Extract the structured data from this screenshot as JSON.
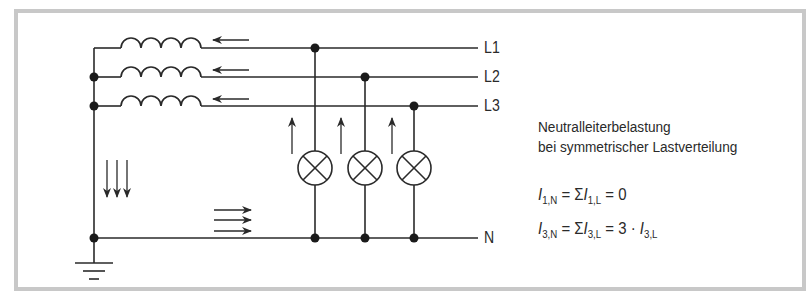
{
  "diagram": {
    "title": "Neutralleiterbelastung bei symmetrischer Lastverteilung",
    "caption_line1": "Neutralleiterbelastung",
    "caption_line2": "bei symmetrischer Lastverteilung",
    "conductors": [
      {
        "id": "L1",
        "label": "L1"
      },
      {
        "id": "L2",
        "label": "L2"
      },
      {
        "id": "L3",
        "label": "L3"
      },
      {
        "id": "N",
        "label": "N"
      }
    ],
    "components": {
      "coils": 3,
      "lamps": 3,
      "ground": 1
    },
    "formulas": [
      {
        "id": "first-harmonic",
        "lhs_var": "I",
        "lhs_sub": "1,N",
        "eq1": " = Σ",
        "mid_var": "I",
        "mid_sub": "1,L",
        "rest": " = 0",
        "tail_var": "",
        "tail_sub": ""
      },
      {
        "id": "third-harmonic",
        "lhs_var": "I",
        "lhs_sub": "3,N",
        "eq1": " = Σ",
        "mid_var": "I",
        "mid_sub": "3,L",
        "rest": " = 3 · ",
        "tail_var": "I",
        "tail_sub": "3,L"
      }
    ],
    "colors": {
      "line": "#2a2a2a",
      "frame": "#c8c8c8",
      "background": "#ffffff"
    }
  }
}
